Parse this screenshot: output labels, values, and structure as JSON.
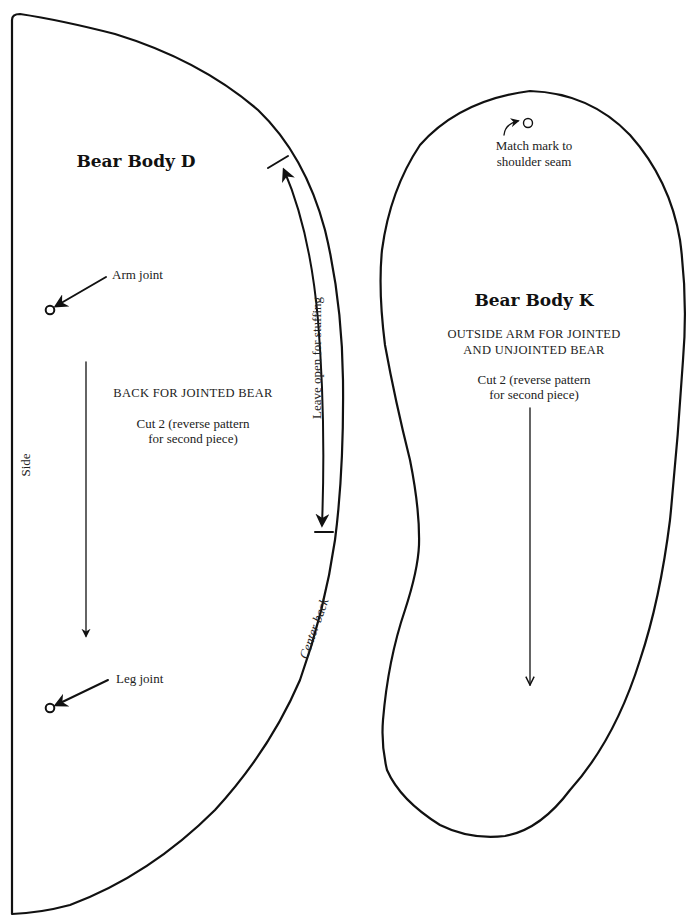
{
  "colors": {
    "ink": "#111111",
    "paper": "#ffffff"
  },
  "piece_d": {
    "title": "Bear Body D",
    "description": "BACK FOR JOINTED BEAR",
    "cut_line1": "Cut 2 (reverse pattern",
    "cut_line2": "for second piece)",
    "arm_joint_label": "Arm joint",
    "leg_joint_label": "Leg joint",
    "side_label": "Side",
    "leave_open_label": "Leave open for stuffing",
    "center_back_label": "Center back"
  },
  "piece_k": {
    "title": "Bear Body K",
    "description_line1": "OUTSIDE ARM FOR JOINTED",
    "description_line2": "AND UNJOINTED BEAR",
    "cut_line1": "Cut 2 (reverse pattern",
    "cut_line2": "for second piece)",
    "match_mark_line1": "Match mark to",
    "match_mark_line2": "shoulder seam"
  }
}
